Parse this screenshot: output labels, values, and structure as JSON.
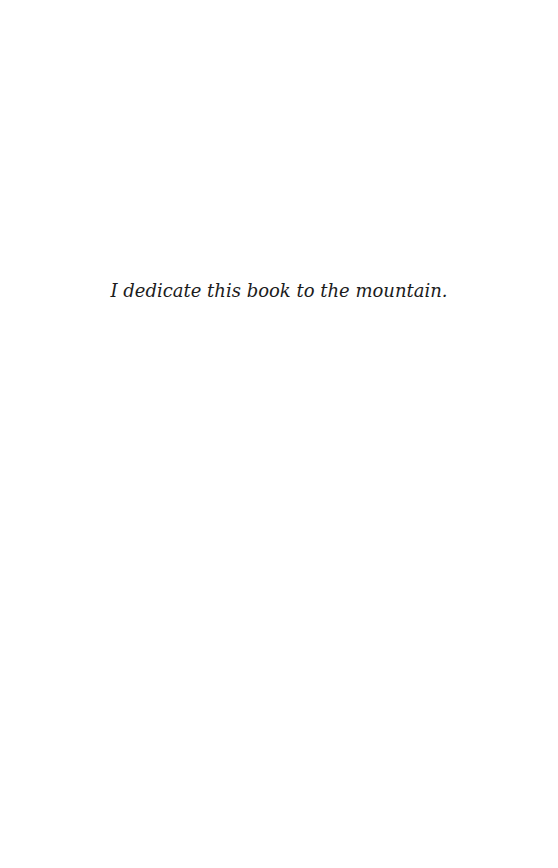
{
  "page": {
    "background": "#ffffff",
    "dedication": "I dedicate this book to the mountain."
  }
}
